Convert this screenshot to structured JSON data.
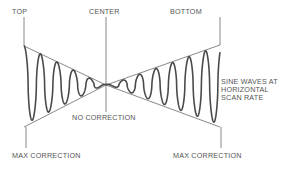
{
  "labels": {
    "top": "TOP",
    "center": "CENTER",
    "bottom": "BOTTOM",
    "no_correction": "NO CORRECTION",
    "max_correction_left": "MAX CORRECTION",
    "max_correction_right": "MAX CORRECTION",
    "note_line1": "SINE WAVES AT",
    "note_line2": "HORIZONTAL",
    "note_line3": "SCAN RATE"
  },
  "colors": {
    "line": "#6a6a6a",
    "wave": "#4a4a4a",
    "text": "#555555",
    "background": "#ffffff"
  },
  "geometry": {
    "center_x": 106,
    "center_y": 85,
    "left_x": 24,
    "right_x": 220,
    "envelope_top_y": 46,
    "envelope_bottom_y": 127,
    "wave_period_px": 16.5
  }
}
